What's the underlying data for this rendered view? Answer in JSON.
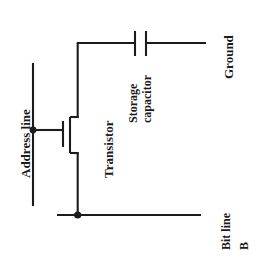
{
  "diagram": {
    "type": "circuit-schematic",
    "background_color": "#ffffff",
    "line_color": "#1b1b1b",
    "text_color": "#1b1b1b",
    "labels": {
      "address_line": "Address line",
      "transistor": "Transistor",
      "storage_capacitor_line1": "Storage",
      "storage_capacitor_line2": "capacitor",
      "ground": "Ground",
      "bit_line": "Bit line",
      "bit_line_b": "B"
    },
    "components": [
      {
        "name": "address-line",
        "kind": "wire-vertical",
        "x": 33,
        "y1": 63,
        "y2": 206,
        "label": "Address line"
      },
      {
        "name": "gate-junction-dot",
        "kind": "junction",
        "x": 33,
        "y": 130
      },
      {
        "name": "gate-wire",
        "kind": "wire-horizontal",
        "y": 130,
        "x1": 33,
        "x2": 63
      },
      {
        "name": "transistor",
        "kind": "mosfet",
        "gate_plate_x": 63,
        "gate_plate_y1": 121,
        "gate_plate_y2": 147,
        "channel_x": 70,
        "channel_y1": 117,
        "channel_y2": 153,
        "drain_y": 117,
        "source_y": 153,
        "terminal_x": 78,
        "label": "Transistor"
      },
      {
        "name": "drain-riser",
        "kind": "wire-vertical",
        "x": 78,
        "y1": 43,
        "y2": 117
      },
      {
        "name": "capacitor-top-wire",
        "kind": "wire-horizontal",
        "y": 43,
        "x1": 78,
        "x2": 135
      },
      {
        "name": "storage-capacitor",
        "kind": "capacitor",
        "plate1_x": 135,
        "plate2_x": 146,
        "plate_y1": 31,
        "plate_y2": 56,
        "label": "Storage capacitor"
      },
      {
        "name": "ground-wire",
        "kind": "wire-horizontal",
        "y": 43,
        "x1": 146,
        "x2": 206,
        "label": "Ground"
      },
      {
        "name": "source-drop",
        "kind": "wire-vertical",
        "x": 78,
        "y1": 153,
        "y2": 215
      },
      {
        "name": "bit-line-junction-dot",
        "kind": "junction",
        "x": 78,
        "y": 215
      },
      {
        "name": "bit-line",
        "kind": "wire-horizontal",
        "y": 215,
        "x1": 57,
        "x2": 201,
        "label": "Bit line B"
      }
    ]
  }
}
